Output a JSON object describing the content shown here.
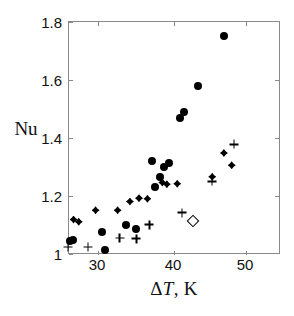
{
  "figure": {
    "background_color": "#ffffff",
    "frame_color": "#8a8a8a",
    "marker_color": "#000000",
    "width": 294,
    "height": 316
  },
  "axes": {
    "x_title_prefix": "Δ",
    "x_title_italic": "T",
    "x_title_suffix": ", K",
    "x_title_full": "ΔT, K",
    "y_title": "Nu",
    "x_ticks": [
      "30",
      "40",
      "50"
    ],
    "y_ticks": [
      "1.8",
      "1.6",
      "1.4",
      "1.2",
      "1"
    ],
    "x_range": [
      26.1,
      58.5
    ],
    "y_range": [
      1.0,
      1.8
    ]
  },
  "chart_data": {
    "type": "scatter",
    "title": "",
    "xlabel": "ΔT, K",
    "ylabel": "Nu",
    "xlim": [
      26.1,
      58.5
    ],
    "ylim": [
      1.0,
      1.8
    ],
    "xticks": [
      30,
      40,
      50
    ],
    "yticks": [
      1.0,
      1.2,
      1.4,
      1.6,
      1.8
    ],
    "grid": false,
    "legend": "none",
    "series": [
      {
        "name": "filled-circle",
        "marker": "circle",
        "filled": true,
        "points": [
          [
            26.2,
            1.042
          ],
          [
            26.7,
            1.044
          ],
          [
            31.2,
            1.072
          ],
          [
            31.7,
            1.012
          ],
          [
            34.9,
            1.098
          ],
          [
            36.4,
            1.082
          ],
          [
            38.9,
            1.318
          ],
          [
            39.3,
            1.228
          ],
          [
            40.2,
            1.262
          ],
          [
            40.8,
            1.298
          ],
          [
            41.5,
            1.31
          ],
          [
            43.3,
            1.468
          ],
          [
            43.8,
            1.488
          ],
          [
            46.0,
            1.58
          ],
          [
            50.0,
            1.75
          ]
        ]
      },
      {
        "name": "filled-diamond",
        "marker": "diamond",
        "filled": true,
        "points": [
          [
            26.8,
            1.116
          ],
          [
            27.6,
            1.108
          ],
          [
            30.2,
            1.148
          ],
          [
            33.6,
            1.148
          ],
          [
            35.5,
            1.178
          ],
          [
            36.9,
            1.19
          ],
          [
            38.2,
            1.188
          ],
          [
            40.5,
            1.244
          ],
          [
            41.2,
            1.238
          ],
          [
            42.8,
            1.24
          ],
          [
            48.2,
            1.264
          ],
          [
            50.0,
            1.346
          ],
          [
            51.2,
            1.304
          ]
        ]
      },
      {
        "name": "plus",
        "marker": "plus",
        "filled": false,
        "points": [
          [
            25.9,
            1.02
          ],
          [
            29.0,
            1.02
          ],
          [
            33.9,
            1.052
          ],
          [
            36.5,
            1.05
          ],
          [
            38.5,
            1.098
          ],
          [
            43.5,
            1.14
          ],
          [
            48.2,
            1.248
          ],
          [
            51.6,
            1.376
          ]
        ]
      },
      {
        "name": "open-diamond",
        "marker": "diamond",
        "filled": false,
        "points": [
          [
            45.2,
            1.11
          ]
        ]
      }
    ]
  }
}
